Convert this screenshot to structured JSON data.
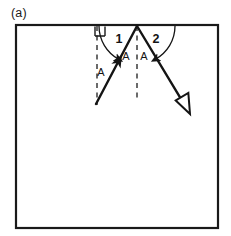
{
  "figure": {
    "panel_label": "(a)",
    "frame": {
      "name": "diagram-border",
      "x": 16,
      "y": 25,
      "width": 202,
      "height": 203,
      "stroke_color": "#1a1a1a",
      "stroke_width": 2.2,
      "fill_color": "#ffffff"
    },
    "colors": {
      "ink": "#141414",
      "line": "#1a1a1a",
      "background": "#ffffff",
      "dashed": "#3a3a3a"
    },
    "vertex": {
      "name": "reflection-point",
      "x": 137,
      "y": 26
    },
    "rays": [
      {
        "name": "incident-ray",
        "from_x": 96,
        "from_y": 104,
        "to_x": 137,
        "to_y": 26,
        "arrow": "solid-mid",
        "stroke_width": 2.4
      },
      {
        "name": "reflected-ray",
        "from_x": 137,
        "from_y": 26,
        "to_x": 190,
        "to_y": 114,
        "arrow": "hollow-end",
        "stroke_width": 2.4
      }
    ],
    "dashed_lines": [
      {
        "name": "left-dashed-vertical",
        "x": 97,
        "y_top": 26,
        "y_bottom": 105
      },
      {
        "name": "center-normal-dashed",
        "x": 137,
        "y_top": 26,
        "y_bottom": 101
      }
    ],
    "right_angle_marker": {
      "name": "right-angle-square",
      "x": 95,
      "y": 26,
      "size": 10
    },
    "angle_arcs": [
      {
        "name": "angle-arc-1",
        "label": "1",
        "label_x": 119,
        "label_y": 43,
        "radius": 38,
        "start_deg": 180,
        "end_deg": 298
      },
      {
        "name": "angle-arc-2",
        "label": "2",
        "label_x": 156,
        "label_y": 43,
        "radius": 38,
        "start_deg": 0,
        "end_deg": 239
      }
    ],
    "side_labels": [
      {
        "name": "label-a-left",
        "text": "A",
        "x": 101,
        "y": 76
      },
      {
        "name": "label-a-inner-left",
        "text": "A",
        "x": 126,
        "y": 60
      },
      {
        "name": "label-a-inner-right",
        "text": "A",
        "x": 144,
        "y": 60
      }
    ]
  }
}
